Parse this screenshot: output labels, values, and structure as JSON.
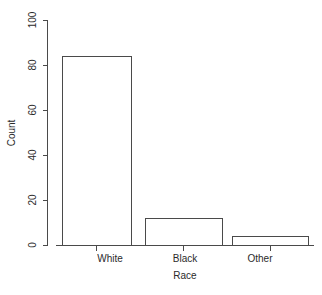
{
  "chart_data": {
    "type": "bar",
    "title": "",
    "subtitle": "",
    "categories": [
      "White",
      "Black",
      "Other"
    ],
    "values": [
      84,
      12,
      4
    ],
    "series": [
      {
        "name": "Count",
        "values": [
          84,
          12,
          4
        ]
      }
    ],
    "xlabel": "Race",
    "ylabel": "Count",
    "ylim": [
      0,
      100
    ],
    "yticks": [
      0,
      20,
      40,
      60,
      80,
      100
    ],
    "ytick_labels": [
      "0",
      "20",
      "40",
      "60",
      "80",
      "100"
    ],
    "xtick_labels": [
      "White",
      "Black",
      "Other"
    ],
    "grid": false,
    "legend": false,
    "legend_position": "none",
    "annotations": [],
    "style": {
      "background": "#ffffff",
      "line_color": "#4a4a4a",
      "bar_fill": "#ffffff",
      "bar_border": "#4a4a4a",
      "text_color": "#2b2b2b",
      "ytick_label_rotation": 90
    }
  }
}
